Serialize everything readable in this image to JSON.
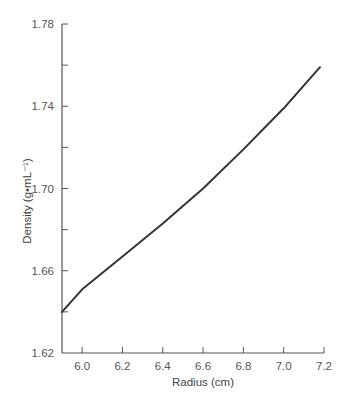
{
  "chart_data": {
    "type": "line",
    "title": "",
    "xlabel": "Radius (cm)",
    "ylabel": "Density (g•mL⁻¹)",
    "xlim": [
      5.9,
      7.2
    ],
    "ylim": [
      1.62,
      1.78
    ],
    "x_ticks": [
      6.0,
      6.2,
      6.4,
      6.6,
      6.8,
      7.0,
      7.2
    ],
    "x_tick_labels": [
      "6.0",
      "6.2",
      "6.4",
      "6.6",
      "6.8",
      "7.0",
      "7.2"
    ],
    "y_ticks_major": [
      1.62,
      1.66,
      1.7,
      1.74,
      1.78
    ],
    "y_tick_labels": [
      "1.62",
      "1.66",
      "1.70",
      "1.74",
      "1.78"
    ],
    "y_ticks_minor": [
      1.64,
      1.68,
      1.72,
      1.76
    ],
    "grid": false,
    "legend": null,
    "series": [
      {
        "name": "Density vs Radius",
        "color": "#333333",
        "x": [
          5.9,
          6.0,
          6.2,
          6.4,
          6.6,
          6.8,
          7.0,
          7.18
        ],
        "y": [
          1.64,
          1.651,
          1.667,
          1.683,
          1.7,
          1.719,
          1.739,
          1.759
        ]
      }
    ]
  },
  "colors": {
    "axis": "#555555",
    "line": "#333333",
    "text": "#555555"
  }
}
